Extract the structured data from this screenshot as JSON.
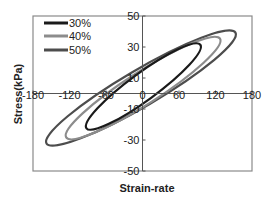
{
  "chart_data": {
    "type": "line",
    "title": "",
    "xlabel": "Strain-rate",
    "ylabel": "Stress(kPa)",
    "xlim": [
      -180,
      180
    ],
    "ylim": [
      -50,
      50
    ],
    "xticks": [
      -180,
      -120,
      -60,
      0,
      60,
      120,
      180
    ],
    "xtick_labels": [
      "-180",
      "-120",
      "-60",
      "0",
      "60",
      "120",
      "180"
    ],
    "yticks": [
      50,
      30,
      10,
      -10,
      -30,
      -50
    ],
    "ytick_labels": [
      "50",
      "30",
      "10",
      "-10",
      "-30",
      "-50"
    ],
    "grid": false,
    "legend_position": "upper-left",
    "series": [
      {
        "name": "30%",
        "color": "#1a1a1a",
        "shape": "hysteresis-loop",
        "x_range": [
          -94,
          97
        ],
        "y_range": [
          -23,
          32
        ]
      },
      {
        "name": "40%",
        "color": "#8c8c8c",
        "shape": "hysteresis-loop",
        "x_range": [
          -128,
          130
        ],
        "y_range": [
          -29,
          36
        ]
      },
      {
        "name": "50%",
        "color": "#4d4d4d",
        "shape": "hysteresis-loop",
        "x_range": [
          -161,
          156
        ],
        "y_range": [
          -33,
          40
        ]
      }
    ]
  },
  "legend": {
    "items": [
      {
        "label": "30%",
        "color": "#1a1a1a"
      },
      {
        "label": "40%",
        "color": "#8c8c8c"
      },
      {
        "label": "50%",
        "color": "#4d4d4d"
      }
    ]
  },
  "axes": {
    "xlabel": "Strain-rate",
    "ylabel": "Stress(kPa)",
    "x_ticks": [
      {
        "label": "-180",
        "value": -180
      },
      {
        "label": "-120",
        "value": -120
      },
      {
        "label": "-60",
        "value": -60
      },
      {
        "label": "0",
        "value": 0
      },
      {
        "label": "60",
        "value": 60
      },
      {
        "label": "120",
        "value": 120
      },
      {
        "label": "180",
        "value": 180
      }
    ],
    "y_ticks": [
      {
        "label": "50",
        "value": 50
      },
      {
        "label": "30",
        "value": 30
      },
      {
        "label": "10",
        "value": 10
      },
      {
        "label": "-10",
        "value": -10
      },
      {
        "label": "-30",
        "value": -30
      },
      {
        "label": "-50",
        "value": -50
      }
    ]
  }
}
